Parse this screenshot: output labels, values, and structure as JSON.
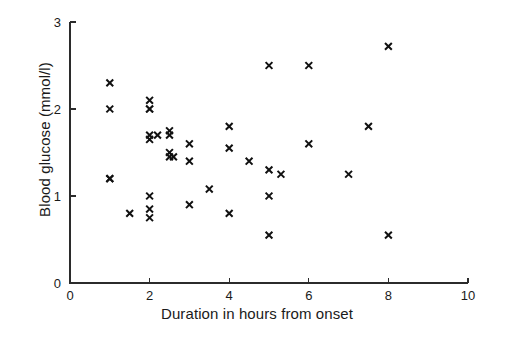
{
  "chart_data": {
    "type": "scatter",
    "title": "",
    "xlabel": "Duration in hours from onset",
    "ylabel": "Blood glucose (mmol/l)",
    "xlim": [
      0,
      10
    ],
    "ylim": [
      0,
      3
    ],
    "xticks": [
      0,
      2,
      4,
      6,
      8,
      10
    ],
    "xtick_labels": [
      "0",
      "2",
      "4",
      "6",
      "8",
      "10"
    ],
    "yticks": [
      0,
      1,
      2,
      3
    ],
    "ytick_labels": [
      "0",
      "1",
      "2",
      "3"
    ],
    "grid": false,
    "legend": false,
    "marker": "x",
    "marker_color": "#111111",
    "points": [
      {
        "x": 1.0,
        "y": 2.3
      },
      {
        "x": 1.0,
        "y": 2.0
      },
      {
        "x": 1.0,
        "y": 1.2
      },
      {
        "x": 1.0,
        "y": 1.2
      },
      {
        "x": 1.5,
        "y": 0.8
      },
      {
        "x": 2.0,
        "y": 2.1
      },
      {
        "x": 2.0,
        "y": 2.0
      },
      {
        "x": 2.0,
        "y": 2.0
      },
      {
        "x": 2.0,
        "y": 1.7
      },
      {
        "x": 2.0,
        "y": 1.65
      },
      {
        "x": 2.0,
        "y": 1.0
      },
      {
        "x": 2.0,
        "y": 0.85
      },
      {
        "x": 2.0,
        "y": 0.75
      },
      {
        "x": 2.2,
        "y": 1.7
      },
      {
        "x": 2.5,
        "y": 1.75
      },
      {
        "x": 2.5,
        "y": 1.7
      },
      {
        "x": 2.5,
        "y": 1.5
      },
      {
        "x": 2.5,
        "y": 1.45
      },
      {
        "x": 2.6,
        "y": 1.45
      },
      {
        "x": 3.0,
        "y": 1.6
      },
      {
        "x": 3.0,
        "y": 1.4
      },
      {
        "x": 3.0,
        "y": 0.9
      },
      {
        "x": 3.5,
        "y": 1.08
      },
      {
        "x": 4.0,
        "y": 1.8
      },
      {
        "x": 4.0,
        "y": 1.55
      },
      {
        "x": 4.0,
        "y": 0.8
      },
      {
        "x": 4.5,
        "y": 1.4
      },
      {
        "x": 5.0,
        "y": 2.5
      },
      {
        "x": 5.0,
        "y": 1.3
      },
      {
        "x": 5.0,
        "y": 1.0
      },
      {
        "x": 5.0,
        "y": 0.55
      },
      {
        "x": 5.3,
        "y": 1.25
      },
      {
        "x": 6.0,
        "y": 2.5
      },
      {
        "x": 6.0,
        "y": 1.6
      },
      {
        "x": 7.0,
        "y": 1.25
      },
      {
        "x": 7.5,
        "y": 1.8
      },
      {
        "x": 8.0,
        "y": 2.72
      },
      {
        "x": 8.0,
        "y": 0.55
      }
    ]
  }
}
